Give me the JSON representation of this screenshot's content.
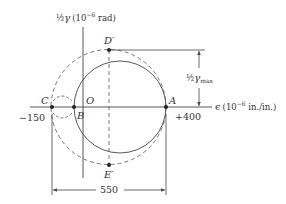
{
  "diagram": {
    "type": "mohr-circle-strain",
    "axes": {
      "vertical_label_prefix": "½",
      "vertical_label_symbol": "γ",
      "vertical_label_units": "(10",
      "vertical_label_exp": "−6",
      "vertical_label_units2": " rad)",
      "horizontal_label_symbol": "ϵ",
      "horizontal_label_units": "(10",
      "horizontal_label_exp": "−6",
      "horizontal_label_units2": " in./in.)"
    },
    "points": {
      "A": "A",
      "B": "B",
      "C": "C",
      "O": "O",
      "D": "D′",
      "E": "E′"
    },
    "values": {
      "left": "−150",
      "right": "+400",
      "span": "550"
    },
    "annotations": {
      "gamma_max_frac": "½",
      "gamma_max_symbol": "γ",
      "gamma_max_sub": "max"
    },
    "colors": {
      "line": "#444444",
      "text": "#333333"
    }
  }
}
